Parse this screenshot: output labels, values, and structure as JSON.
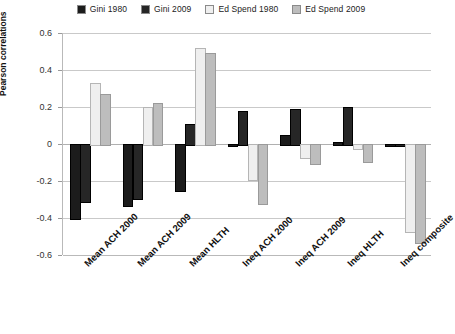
{
  "chart_data": {
    "type": "bar",
    "title": "",
    "xlabel": "",
    "ylabel": "Pearson correlations",
    "ylim": [
      -0.6,
      0.6
    ],
    "ytick_labels": [
      "0.6",
      "0.4",
      "0.2",
      "0",
      "-0.2",
      "-0.4",
      "-0.6"
    ],
    "ytick_values": [
      0.6,
      0.4,
      0.2,
      0,
      -0.2,
      -0.4,
      -0.6
    ],
    "grid": true,
    "legend_position": "top-center",
    "categories": [
      "Mean ACH 2000",
      "Mean ACH 2009",
      "Mean HLTH",
      "Ineq ACH 2000",
      "Ineq ACH 2009",
      "Ineq HLTH",
      "Ineq composite"
    ],
    "series": [
      {
        "name": "Gini 1980",
        "color": "#1c1c1c",
        "values": [
          -0.4,
          -0.33,
          -0.25,
          0.0,
          0.05,
          0.01,
          0.0
        ]
      },
      {
        "name": "Gini 2009",
        "color": "#262626",
        "values": [
          -0.31,
          -0.29,
          0.11,
          0.18,
          0.19,
          0.2,
          0.0
        ]
      },
      {
        "name": "Ed Spend 1980",
        "color": "#efefef",
        "values": [
          0.33,
          0.2,
          0.52,
          -0.19,
          -0.07,
          -0.02,
          -0.47
        ]
      },
      {
        "name": "Ed Spend 2009",
        "color": "#bdbdbd",
        "values": [
          0.27,
          0.22,
          0.49,
          -0.32,
          -0.1,
          -0.09,
          -0.53
        ]
      }
    ]
  }
}
